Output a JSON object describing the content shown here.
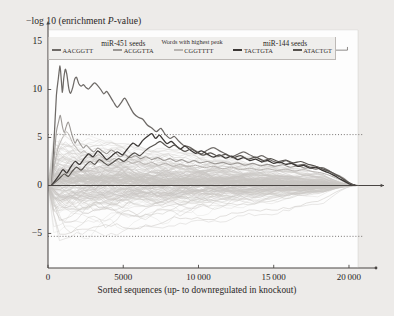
{
  "chart_data": {
    "type": "line",
    "title": "",
    "ylabel": "−log 10 (enrichment P-value)",
    "ylabel_prefix": "−log 10 (enrichment ",
    "ylabel_italic": "P",
    "ylabel_suffix": "-value)",
    "xlabel": "Sorted sequences (up- to downregulated in knockout)",
    "xlim": [
      0,
      20600
    ],
    "ylim": [
      -8.6,
      16.2
    ],
    "yticks": [
      15,
      10,
      5,
      0,
      -5
    ],
    "ytick_labels": [
      "15",
      "10",
      "5",
      "0",
      "−5"
    ],
    "xticks": [
      0,
      5000,
      10000,
      15000,
      20000
    ],
    "xtick_labels": [
      "0",
      "5000",
      "10 000",
      "15 000",
      "20 000"
    ],
    "grid": false,
    "zero_line": 0,
    "threshold_lines": [
      5.3,
      -5.3
    ],
    "threshold_style": "dotted",
    "background_curve_count": 180,
    "background_curve_color": "#c9c6c3",
    "legend": {
      "position": "top-inside",
      "title": "Words with highest peak",
      "entries": [
        {
          "label": "AACGGTT",
          "color": "#6e6a67",
          "peak": 12.5,
          "peak_x": 900
        },
        {
          "label": "ACGGTTA",
          "color": "#9c9895",
          "peak": 7.3,
          "peak_x": 1100
        },
        {
          "label": "CGGTTTT",
          "color": "#b8b4b1",
          "peak": 5.6,
          "peak_x": 1500
        },
        {
          "label": "TACTGTA",
          "color": "#3b3735",
          "peak": 5.4,
          "peak_x": 6900
        },
        {
          "label": "ATACTGT",
          "color": "#57534f",
          "peak": 4.6,
          "peak_x": 7600
        }
      ]
    },
    "annotations": [
      {
        "name": "mir451-bracket",
        "label": "miR-451 seeds",
        "x_start": 300,
        "x_end": 9700,
        "y": 14.1
      },
      {
        "name": "mir144-bracket",
        "label": "miR-144 seeds",
        "x_start": 11600,
        "x_end": 19900,
        "y": 14.1
      }
    ],
    "series": [
      {
        "name": "AACGGTT",
        "color": "#6e6a67",
        "width": 1.25,
        "x": [
          250,
          420,
          560,
          700,
          800,
          880,
          960,
          1050,
          1150,
          1250,
          1380,
          1500,
          1640,
          1780,
          1900,
          2050,
          2200,
          2350,
          2500,
          2700,
          2900,
          3100,
          3300,
          3500,
          3700,
          3900,
          4100,
          4350,
          4600,
          4850,
          5100,
          5400,
          5700,
          6000,
          6300,
          6600,
          6900,
          7200,
          7500,
          7800,
          8100,
          8400,
          8700,
          9000,
          9400,
          9800,
          10200,
          10600,
          11000,
          11400,
          11800,
          12200,
          12600,
          13000,
          13400,
          13800,
          14200,
          14600,
          15000,
          15400,
          15800,
          16200,
          16600,
          17000,
          17400,
          17800,
          18200,
          18600,
          19000,
          19400,
          19800,
          20100,
          20400
        ],
        "y": [
          0.2,
          5.2,
          9.4,
          11.3,
          12.45,
          11.1,
          9.7,
          11.2,
          12.1,
          11.6,
          10.1,
          9.6,
          10.2,
          11.1,
          11.25,
          10.6,
          10.35,
          10.5,
          10.25,
          10.05,
          10.4,
          10.7,
          10.4,
          10.0,
          9.55,
          9.8,
          9.35,
          8.7,
          8.15,
          8.6,
          9.1,
          8.3,
          7.5,
          7.1,
          6.9,
          6.3,
          6.0,
          5.6,
          5.95,
          5.3,
          4.9,
          5.1,
          4.6,
          4.2,
          4.0,
          3.6,
          3.3,
          3.7,
          3.95,
          3.6,
          3.3,
          3.0,
          3.25,
          3.5,
          3.2,
          2.9,
          3.1,
          2.8,
          2.5,
          2.35,
          2.6,
          2.3,
          2.1,
          2.2,
          1.9,
          1.7,
          1.85,
          1.6,
          1.2,
          0.9,
          0.45,
          0.15,
          0.05
        ]
      },
      {
        "name": "ACGGTTA",
        "color": "#9c9895",
        "width": 1.1,
        "x": [
          250,
          420,
          560,
          700,
          820,
          950,
          1080,
          1200,
          1350,
          1500,
          1650,
          1800,
          1950,
          2150,
          2350,
          2550,
          2800,
          3050,
          3300,
          3600,
          3900,
          4200,
          4500,
          4800,
          5100,
          5450,
          5800,
          6150,
          6500,
          6900,
          7300,
          7700,
          8100,
          8500,
          8900,
          9300,
          9700,
          10100,
          10600,
          11100,
          11600,
          12100,
          12600,
          13100,
          13600,
          14100,
          14600,
          15100,
          15600,
          16100,
          16600,
          17100,
          17600,
          18100,
          18600,
          19100,
          19600,
          20000,
          20300
        ],
        "y": [
          0.15,
          3.1,
          5.6,
          6.6,
          7.3,
          6.2,
          5.5,
          6.1,
          6.6,
          5.8,
          5.0,
          4.4,
          4.8,
          4.3,
          3.9,
          4.2,
          3.8,
          3.5,
          3.9,
          3.6,
          3.3,
          3.7,
          3.4,
          3.0,
          3.2,
          2.9,
          3.1,
          2.8,
          3.0,
          2.7,
          2.9,
          2.6,
          2.8,
          2.5,
          2.7,
          2.4,
          2.6,
          2.35,
          2.5,
          2.25,
          2.4,
          2.2,
          2.35,
          2.1,
          2.3,
          2.05,
          2.2,
          2.0,
          2.15,
          1.9,
          2.05,
          1.8,
          1.95,
          1.7,
          1.5,
          1.2,
          0.8,
          0.3,
          0.05
        ]
      },
      {
        "name": "CGGTTTT",
        "color": "#b8b4b1",
        "width": 1.0,
        "x": [
          250,
          450,
          650,
          850,
          1050,
          1250,
          1450,
          1650,
          1900,
          2150,
          2400,
          2700,
          3000,
          3350,
          3700,
          4050,
          4400,
          4800,
          5200,
          5600,
          6000,
          6450,
          6900,
          7350,
          7800,
          8300,
          8800,
          9300,
          9800,
          10400,
          11000,
          11600,
          12200,
          12800,
          13400,
          14000,
          14600,
          15200,
          15800,
          16400,
          17000,
          17600,
          18200,
          18800,
          19400,
          19900,
          20300
        ],
        "y": [
          0.1,
          2.3,
          3.8,
          4.6,
          5.2,
          5.6,
          5.1,
          4.4,
          3.9,
          3.4,
          3.6,
          3.2,
          2.9,
          3.2,
          2.8,
          2.5,
          2.8,
          2.4,
          2.6,
          2.3,
          2.5,
          2.2,
          2.4,
          2.1,
          2.3,
          2.0,
          2.2,
          1.95,
          2.1,
          1.85,
          2.0,
          1.75,
          1.9,
          1.65,
          1.8,
          1.6,
          1.75,
          1.55,
          1.7,
          1.5,
          1.65,
          1.45,
          1.3,
          1.0,
          0.6,
          0.2,
          0.05
        ]
      },
      {
        "name": "TACTGTA",
        "color": "#3b3735",
        "width": 1.3,
        "x": [
          250,
          500,
          750,
          1000,
          1250,
          1500,
          1800,
          2100,
          2400,
          2700,
          3000,
          3300,
          3600,
          3900,
          4250,
          4600,
          4950,
          5300,
          5650,
          6000,
          6300,
          6600,
          6900,
          7150,
          7400,
          7650,
          7900,
          8200,
          8500,
          8800,
          9100,
          9450,
          9800,
          10200,
          10600,
          11000,
          11400,
          11800,
          12200,
          12600,
          13000,
          13400,
          13800,
          14200,
          14600,
          15000,
          15400,
          15800,
          16200,
          16600,
          17000,
          17400,
          17800,
          18200,
          18600,
          19000,
          19400,
          19800,
          20100,
          20400
        ],
        "y": [
          0.05,
          0.55,
          1.1,
          1.65,
          1.3,
          1.9,
          2.5,
          2.2,
          2.8,
          3.3,
          3.0,
          3.6,
          3.2,
          2.7,
          3.1,
          3.5,
          3.2,
          3.85,
          4.4,
          4.1,
          4.7,
          5.1,
          5.4,
          4.9,
          5.25,
          4.8,
          4.35,
          4.6,
          4.15,
          3.8,
          4.1,
          3.7,
          3.35,
          3.6,
          3.25,
          2.95,
          3.2,
          2.85,
          3.05,
          2.7,
          2.9,
          2.6,
          2.75,
          2.45,
          2.6,
          2.3,
          2.45,
          2.2,
          2.3,
          2.0,
          2.1,
          1.8,
          1.9,
          1.6,
          1.35,
          1.05,
          0.7,
          0.35,
          0.1,
          0.02
        ]
      },
      {
        "name": "ATACTGT",
        "color": "#57534f",
        "width": 1.2,
        "x": [
          250,
          520,
          800,
          1080,
          1350,
          1620,
          1900,
          2200,
          2500,
          2800,
          3100,
          3400,
          3700,
          4000,
          4350,
          4700,
          5050,
          5400,
          5750,
          6100,
          6450,
          6800,
          7150,
          7450,
          7750,
          8050,
          8400,
          8750,
          9100,
          9500,
          9900,
          10300,
          10800,
          11300,
          11800,
          12300,
          12800,
          13300,
          13800,
          14300,
          14800,
          15300,
          15800,
          16300,
          16800,
          17300,
          17800,
          18300,
          18800,
          19300,
          19800,
          20200,
          20400
        ],
        "y": [
          0.05,
          0.4,
          0.8,
          1.2,
          0.95,
          1.5,
          1.9,
          1.6,
          2.1,
          2.5,
          2.2,
          2.7,
          2.4,
          2.1,
          2.45,
          2.8,
          2.5,
          3.0,
          3.4,
          3.1,
          3.6,
          4.0,
          4.3,
          4.6,
          4.25,
          3.95,
          4.2,
          3.85,
          3.55,
          3.8,
          3.45,
          3.15,
          3.4,
          3.05,
          3.25,
          2.9,
          3.1,
          2.75,
          2.95,
          2.6,
          2.8,
          2.5,
          2.65,
          2.35,
          2.5,
          2.2,
          2.0,
          1.7,
          1.4,
          1.0,
          0.5,
          0.15,
          0.03
        ]
      }
    ]
  },
  "plot": {
    "axis_color": "#4a4644",
    "frame_color": "#bdb9b6",
    "plot_bg": "#fdfdfd",
    "page_bg": "#edebe9"
  }
}
